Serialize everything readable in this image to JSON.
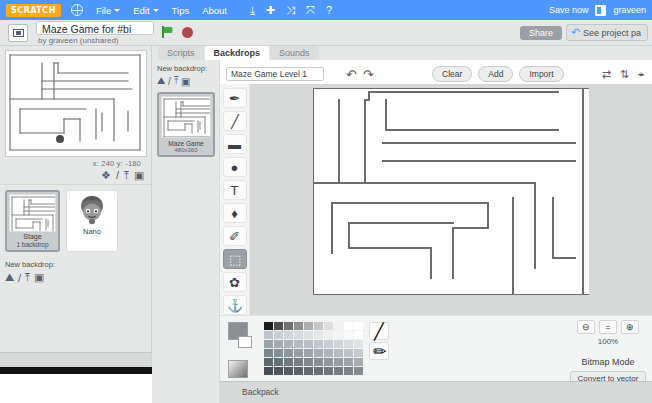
{
  "menubar": {
    "logo": "SCRATCH",
    "globe_icon": "globe-icon",
    "items": [
      {
        "label": "File",
        "has_caret": true
      },
      {
        "label": "Edit",
        "has_caret": true
      },
      {
        "label": "Tips",
        "has_caret": false
      },
      {
        "label": "About",
        "has_caret": false
      }
    ],
    "icons": [
      {
        "name": "download-icon",
        "glyph": "⤓"
      },
      {
        "name": "add-icon",
        "glyph": "✚"
      },
      {
        "name": "shrink-icon",
        "glyph": "⤨"
      },
      {
        "name": "grow-icon",
        "glyph": "⤧"
      },
      {
        "name": "help-icon",
        "glyph": "?"
      }
    ],
    "save_now": "Save now",
    "username": "graveen",
    "accent_color": "#4d97ff",
    "logo_color": "#ffab19"
  },
  "projectbar": {
    "see_inside_icon": "see-inside-icon",
    "title": "Maze Game for #bi",
    "author": "by graveen (unshared)",
    "green_flag_icon": "green-flag-icon",
    "stop_icon": "stop-icon",
    "share_label": "Share",
    "see_project_page": "See project pa",
    "back_arrow_icon": "back-arrow-icon"
  },
  "stage_panel": {
    "coords": "x: 240   y: -180",
    "sprite_tools": [
      {
        "name": "new-sprite-icon",
        "glyph": "❖"
      },
      {
        "name": "paint-sprite-icon",
        "glyph": "/"
      },
      {
        "name": "upload-sprite-icon",
        "glyph": "⤒"
      },
      {
        "name": "camera-sprite-icon",
        "glyph": "▣"
      }
    ],
    "stage_label": "Stage",
    "stage_sublabel": "1 backdrop",
    "sprites": [
      {
        "name": "Nano"
      }
    ],
    "new_backdrop_label": "New backdrop:",
    "new_backdrop_icons": [
      {
        "name": "backdrop-library-icon",
        "glyph": "⛰"
      },
      {
        "name": "paint-backdrop-icon",
        "glyph": "/"
      },
      {
        "name": "upload-backdrop-icon",
        "glyph": "⤒"
      },
      {
        "name": "camera-backdrop-icon",
        "glyph": "▣"
      }
    ]
  },
  "tabs": [
    {
      "label": "Scripts",
      "active": false
    },
    {
      "label": "Backdrops",
      "active": true
    },
    {
      "label": "Sounds",
      "active": false
    }
  ],
  "backdrop_list": {
    "new_backdrop_label": "New backdrop:",
    "new_backdrop_icons": [
      {
        "name": "backdrop-library-icon",
        "glyph": "⛰"
      },
      {
        "name": "paint-backdrop-icon",
        "glyph": "/"
      },
      {
        "name": "upload-backdrop-icon",
        "glyph": "⤒"
      },
      {
        "name": "camera-backdrop-icon",
        "glyph": "▣"
      }
    ],
    "items": [
      {
        "number": "1",
        "name": "Maze Game",
        "dimensions": "480x360"
      }
    ]
  },
  "paint_editor": {
    "costume_name": "Maze Game Level 1",
    "undo_icon": "undo-icon",
    "redo_icon": "redo-icon",
    "buttons": [
      {
        "label": "Clear",
        "name": "clear-button"
      },
      {
        "label": "Add",
        "name": "add-button"
      },
      {
        "label": "Import",
        "name": "import-button"
      }
    ],
    "transform_icons": [
      {
        "name": "flip-horizontal-icon",
        "glyph": "⇄"
      },
      {
        "name": "flip-vertical-icon",
        "glyph": "⇅"
      },
      {
        "name": "set-center-icon",
        "glyph": "⌖"
      }
    ],
    "tools": [
      {
        "name": "brush-tool",
        "glyph": "✒",
        "active": false
      },
      {
        "name": "line-tool",
        "glyph": "╱",
        "active": false
      },
      {
        "name": "rectangle-tool",
        "glyph": "▬",
        "active": false
      },
      {
        "name": "ellipse-tool",
        "glyph": "●",
        "active": false
      },
      {
        "name": "text-tool",
        "glyph": "T",
        "active": false
      },
      {
        "name": "fill-tool",
        "glyph": "♦",
        "active": false
      },
      {
        "name": "eraser-tool",
        "glyph": "✐",
        "active": false
      },
      {
        "name": "select-tool",
        "glyph": "⬚",
        "active": true
      },
      {
        "name": "reshape-tool",
        "glyph": "✿",
        "active": false
      },
      {
        "name": "stamp-tool",
        "glyph": "⚓",
        "active": false
      }
    ],
    "zoom": {
      "zoom_out_icon": "zoom-out-icon",
      "zoom_reset_icon": "zoom-reset-icon",
      "zoom_in_icon": "zoom-in-icon",
      "percent": "100%"
    },
    "mode_label": "Bitmap Mode",
    "convert_label": "Convert to vector",
    "foreground_color": "#8a8f94",
    "background_color": "#ffffff",
    "palette_colors": [
      "#1b1b1b",
      "#4d4d4d",
      "#707070",
      "#8f8f8f",
      "#adadad",
      "#c6c6c6",
      "#dedede",
      "#f2f2f2",
      "#ffffff",
      "#ffffff",
      "#bfc6cc",
      "#c8cfd4",
      "#cfd4d8",
      "#d6dadd",
      "#dde0e2",
      "#e4e6e8",
      "#eceeef",
      "#f4f5f6",
      "#fafafa",
      "#ffffff",
      "#9aa3aa",
      "#a3abb2",
      "#aab2b8",
      "#b2b9bf",
      "#b9c0c5",
      "#c1c7cc",
      "#c8ced2",
      "#d0d5d9",
      "#d8dbde",
      "#e0e3e5",
      "#7b858d",
      "#848e96",
      "#8c959d",
      "#949da4",
      "#9ca4ab",
      "#a4acb2",
      "#acb3b9",
      "#b4bbc0",
      "#bcc2c7",
      "#c4c9cd",
      "#5e686f",
      "#667077",
      "#6e777e",
      "#767f86",
      "#7e878d",
      "#868e94",
      "#8e969b",
      "#969da2",
      "#9ea5aa",
      "#a6acb1",
      "#454d53",
      "#4c545a",
      "#535b61",
      "#5a6268",
      "#61696e",
      "#687075",
      "#6f767b",
      "#767d82",
      "#7d8488",
      "#848b8f"
    ],
    "line_color_icon": "line-color-icon",
    "eyedropper_icon": "eyedropper-icon"
  },
  "bottom": {
    "backpack_label": "Backpack"
  },
  "maze_walls": {
    "stage_thumb": [
      [
        4,
        4,
        134,
        4
      ],
      [
        4,
        4,
        4,
        99
      ],
      [
        4,
        99,
        134,
        99
      ],
      [
        134,
        4,
        134,
        99
      ],
      [
        36,
        12,
        36,
        48
      ],
      [
        48,
        12,
        48,
        48
      ],
      [
        48,
        12,
        52,
        12
      ],
      [
        52,
        12,
        52,
        22
      ],
      [
        52,
        22,
        122,
        22
      ],
      [
        36,
        30,
        122,
        30
      ],
      [
        36,
        38,
        126,
        38
      ],
      [
        4,
        48,
        108,
        48
      ],
      [
        108,
        48,
        108,
        90
      ],
      [
        14,
        58,
        80,
        58
      ],
      [
        14,
        58,
        14,
        82
      ],
      [
        14,
        82,
        58,
        82
      ],
      [
        58,
        82,
        58,
        68
      ],
      [
        58,
        68,
        74,
        68
      ],
      [
        74,
        68,
        74,
        90
      ],
      [
        90,
        58,
        90,
        88
      ],
      [
        96,
        62,
        96,
        80
      ],
      [
        122,
        60,
        122,
        80
      ]
    ],
    "backdrop_thumb": [
      [
        2,
        2,
        54,
        2
      ],
      [
        2,
        2,
        2,
        40
      ],
      [
        2,
        40,
        54,
        40
      ],
      [
        54,
        2,
        54,
        40
      ],
      [
        14,
        5,
        14,
        20
      ],
      [
        19,
        5,
        19,
        20
      ],
      [
        19,
        5,
        21,
        5
      ],
      [
        21,
        5,
        21,
        9
      ],
      [
        21,
        9,
        49,
        9
      ],
      [
        14,
        12,
        49,
        12
      ],
      [
        14,
        16,
        51,
        16
      ],
      [
        2,
        20,
        43,
        20
      ],
      [
        43,
        20,
        43,
        36
      ],
      [
        6,
        24,
        32,
        24
      ],
      [
        6,
        24,
        6,
        33
      ],
      [
        6,
        33,
        23,
        33
      ],
      [
        23,
        33,
        23,
        27
      ],
      [
        23,
        27,
        30,
        27
      ],
      [
        30,
        27,
        30,
        36
      ],
      [
        36,
        24,
        36,
        35
      ],
      [
        38,
        25,
        38,
        32
      ],
      [
        49,
        24,
        49,
        32
      ]
    ],
    "canvas": [
      [
        0,
        0,
        276,
        0
      ],
      [
        0,
        0,
        0,
        207
      ],
      [
        0,
        207,
        276,
        207
      ],
      [
        270,
        0,
        270,
        207
      ],
      [
        26,
        12,
        26,
        95
      ],
      [
        52,
        12,
        52,
        95
      ],
      [
        52,
        12,
        56,
        12
      ],
      [
        56,
        12,
        56,
        4
      ],
      [
        56,
        4,
        245,
        4
      ],
      [
        73,
        12,
        73,
        42
      ],
      [
        73,
        42,
        245,
        42
      ],
      [
        70,
        55,
        262,
        55
      ],
      [
        70,
        73,
        262,
        73
      ],
      [
        0,
        95,
        222,
        95
      ],
      [
        222,
        95,
        222,
        180
      ],
      [
        19,
        115,
        19,
        165
      ],
      [
        19,
        115,
        175,
        115
      ],
      [
        175,
        115,
        175,
        140
      ],
      [
        140,
        140,
        175,
        140
      ],
      [
        140,
        140,
        140,
        190
      ],
      [
        36,
        135,
        140,
        135
      ],
      [
        36,
        135,
        36,
        160
      ],
      [
        36,
        160,
        118,
        160
      ],
      [
        118,
        160,
        118,
        190
      ],
      [
        200,
        110,
        200,
        172
      ],
      [
        240,
        110,
        240,
        170
      ],
      [
        240,
        170,
        262,
        170
      ],
      [
        200,
        172,
        200,
        207
      ]
    ]
  }
}
